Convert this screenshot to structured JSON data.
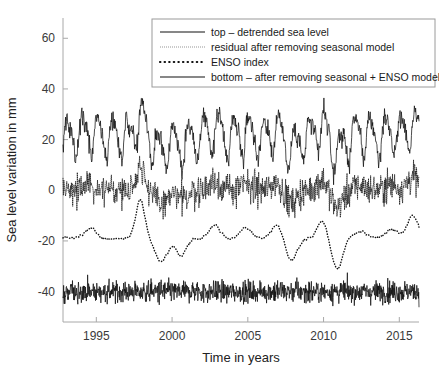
{
  "chart_data": {
    "type": "line",
    "title": "",
    "xlabel": "Time in years",
    "ylabel": "Sea level variation in mm",
    "xlim": [
      1992.8,
      2016.3
    ],
    "ylim": [
      -52,
      68
    ],
    "xticks": [
      1995,
      2000,
      2005,
      2010,
      2015
    ],
    "xticklabels": [
      "1995",
      "2000",
      "2005",
      "2010",
      "2015"
    ],
    "yticks": [
      60,
      40,
      20,
      0,
      -20,
      -40
    ],
    "yticklabels": [
      "60",
      "40",
      "20",
      "0",
      "-20",
      "-40"
    ],
    "grid": false,
    "legend_position": "top-center",
    "series": [
      {
        "name": "top - detrended sea level",
        "legend_label": "top – detrended sea level",
        "style": "solid",
        "offset_mm": 21,
        "seasonal_amplitude_mm": 7.5,
        "seasonal_phase": 0.12,
        "semiannual_amplitude_mm": 2.2,
        "noise_amplitude_mm": 3.4,
        "enso_coupling": 0.55,
        "samples_per_year": 36,
        "description": "Detrended sea level anomaly oscillating about +21 mm with a strong annual cycle; range roughly +8 to +38 mm, peak near 2016 reaching about +38 mm."
      },
      {
        "name": "residual after removing seasonal model",
        "legend_label": "residual after removing seasonal model",
        "style": "dotted-fine",
        "offset_mm": 0,
        "seasonal_amplitude_mm": 0,
        "seasonal_phase": 0,
        "semiannual_amplitude_mm": 0,
        "noise_amplitude_mm": 5.2,
        "enso_coupling": 0.6,
        "samples_per_year": 36,
        "description": "Residual after removing the seasonal model, scattered about 0 mm between roughly -14 and +14 mm."
      },
      {
        "name": "ENSO index",
        "legend_label": "ENSO index",
        "style": "dotted-coarse",
        "offset_mm": -19,
        "seasonal_amplitude_mm": 0,
        "seasonal_phase": 0,
        "semiannual_amplitude_mm": 0,
        "noise_amplitude_mm": 0.7,
        "enso_coupling": 1.0,
        "samples_per_year": 24,
        "description": "Smooth ENSO index drawn about -19 mm; large positive spike during the 1997-1998 El Nino reaching about -5 mm and deep negative excursions in 1999-2000 and 2010-2011 down to about -30 mm."
      },
      {
        "name": "bottom - after removing seasonal + ENSO model",
        "legend_label": "bottom – after removing seasonal + ENSO model",
        "style": "solid",
        "offset_mm": -40,
        "seasonal_amplitude_mm": 0,
        "seasonal_phase": 0,
        "semiannual_amplitude_mm": 0,
        "noise_amplitude_mm": 3.6,
        "enso_coupling": 0.0,
        "samples_per_year": 48,
        "description": "High-frequency residual noise about -40 mm after removing both seasonal and ENSO models, spanning roughly -50 to -31 mm."
      }
    ],
    "enso_events": [
      {
        "year": 1994.6,
        "amplitude": 4.0,
        "width": 0.55
      },
      {
        "year": 1997.9,
        "amplitude": 15.5,
        "width": 0.42
      },
      {
        "year": 1999.3,
        "amplitude": -9.5,
        "width": 0.55
      },
      {
        "year": 2000.6,
        "amplitude": -6.5,
        "width": 0.5
      },
      {
        "year": 2002.8,
        "amplitude": 5.5,
        "width": 0.5
      },
      {
        "year": 2004.9,
        "amplitude": 4.0,
        "width": 0.5
      },
      {
        "year": 2006.9,
        "amplitude": 5.0,
        "width": 0.45
      },
      {
        "year": 2007.9,
        "amplitude": -8.5,
        "width": 0.5
      },
      {
        "year": 2009.9,
        "amplitude": 7.0,
        "width": 0.45
      },
      {
        "year": 2010.9,
        "amplitude": -11.5,
        "width": 0.5
      },
      {
        "year": 2012.4,
        "amplitude": 3.0,
        "width": 0.5
      },
      {
        "year": 2014.5,
        "amplitude": 3.5,
        "width": 0.6
      },
      {
        "year": 2015.9,
        "amplitude": 9.0,
        "width": 0.5
      }
    ]
  },
  "axes": {
    "xlabel": "Time in years",
    "ylabel": "Sea level variation in mm"
  },
  "legend": {
    "entries": [
      {
        "label": "top – detrended sea level",
        "style": "solid"
      },
      {
        "label": "residual after removing seasonal model",
        "style": "dotted-fine"
      },
      {
        "label": "ENSO index",
        "style": "dotted-coarse"
      },
      {
        "label": "bottom – after removing seasonal + ENSO model",
        "style": "solid"
      }
    ]
  },
  "colors": {
    "background": "#ffffff",
    "axis": "#a8a8a8",
    "text": "#222222",
    "data": "#111111"
  }
}
